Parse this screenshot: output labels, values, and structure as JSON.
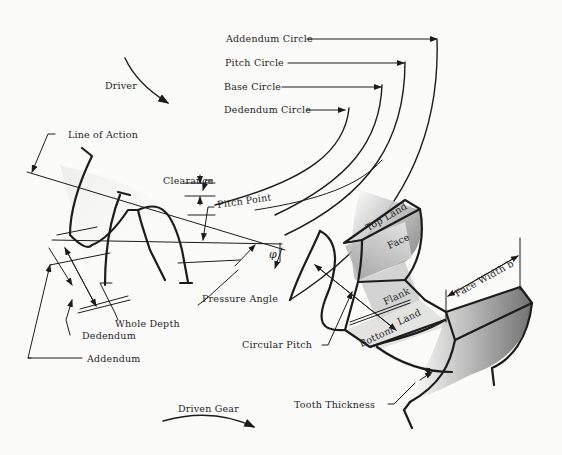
{
  "diagram": {
    "colors": {
      "ink": "#1c1c1c",
      "paper": "#fbfbf9",
      "shade": "#8a8a8a"
    },
    "labels": {
      "addendum_circle": "Addendum Circle",
      "pitch_circle": "Pitch Circle",
      "base_circle": "Base Circle",
      "dedendum_circle": "Dedendum Circle",
      "driver": "Driver",
      "line_of_action": "Line of Action",
      "clearance": "Clearance",
      "pitch_point": "Pitch Point",
      "phi": "φ",
      "pressure_angle": "Pressure Angle",
      "whole_depth": "Whole Depth",
      "dedendum": "Dedendum",
      "addendum": "Addendum",
      "top_land": "Top Land",
      "face": "Face",
      "flank": "Flank",
      "bottom_land_1": "Bottom",
      "bottom_land_2": "Land",
      "face_width": "Face Width b",
      "circular_pitch": "Circular Pitch",
      "tooth_thickness": "Tooth Thickness",
      "driven_gear": "Driven Gear"
    }
  }
}
